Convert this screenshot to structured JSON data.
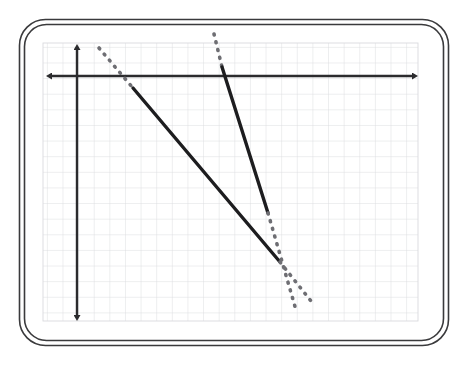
{
  "page": {
    "background_color": "#ffffff",
    "width": 464,
    "height": 367
  },
  "board": {
    "name": "whiteboard-frame",
    "style": "double rounded rectangle outline",
    "outer": {
      "x": 19,
      "y": 19,
      "width": 430,
      "height": 327,
      "radius": 26
    },
    "inner": {
      "x": 24,
      "y": 24,
      "width": 420,
      "height": 317,
      "radius": 22
    },
    "stroke_color": "#3a3a3c",
    "stroke_width": 1.6,
    "fill_color": "#ffffff"
  },
  "grid": {
    "name": "coordinate-grid",
    "x": 43,
    "y": 43,
    "width": 375,
    "height": 278,
    "cell_size": 15.62,
    "columns": 24,
    "rows": 18,
    "line_color": "#d9dadd",
    "line_width": 0.9,
    "grid_on": true
  },
  "axes": {
    "color": "#2b2b2d",
    "line_width": 2.4,
    "x_axis": {
      "label": "x-axis",
      "y": 76,
      "x_start": 47,
      "x_end": 417,
      "arrows": "both"
    },
    "y_axis": {
      "label": "y-axis",
      "x": 77,
      "y_start": 45,
      "y_end": 320,
      "arrows": "both"
    }
  },
  "chart_data": {
    "type": "line",
    "title": "",
    "xlabel": "",
    "ylabel": "",
    "grid": true,
    "legend_position": "none",
    "origin_px": {
      "x": 77,
      "y": 76
    },
    "unit_px": 15.62,
    "series": [
      {
        "name": "line-1",
        "description": "Negative-slope line, solid segment with dashed extensions at both ends",
        "color": "#1d1d1f",
        "solid_width": 3.4,
        "dash_width": 3.6,
        "dash_pattern": "1 7",
        "solid_segment_px": {
          "x1": 133,
          "y1": 88,
          "x2": 280,
          "y2": 262
        },
        "dash_extension_start_px": {
          "x1": 99,
          "y1": 48,
          "x2": 133,
          "y2": 88
        },
        "dash_extension_end_px": {
          "x1": 280,
          "y1": 262,
          "x2": 311,
          "y2": 301
        },
        "slope_approx": -1.18,
        "points_units": [
          {
            "x": 3.6,
            "y": 1.8
          },
          {
            "x": 13.0,
            "y": -11.9
          }
        ]
      },
      {
        "name": "line-2",
        "description": "Steep negative-slope line, solid segment with dashed extensions at both ends",
        "color": "#1d1d1f",
        "solid_width": 3.4,
        "dash_width": 3.6,
        "dash_pattern": "1 7",
        "solid_segment_px": {
          "x1": 222,
          "y1": 67,
          "x2": 268,
          "y2": 213
        },
        "dash_extension_start_px": {
          "x1": 214,
          "y1": 34,
          "x2": 222,
          "y2": 67
        },
        "dash_extension_end_px": {
          "x1": 268,
          "y1": 213,
          "x2": 296,
          "y2": 310
        },
        "slope_approx": -3.17,
        "points_units": [
          {
            "x": 9.3,
            "y": 0.6
          },
          {
            "x": 12.2,
            "y": -8.8
          }
        ]
      }
    ]
  }
}
